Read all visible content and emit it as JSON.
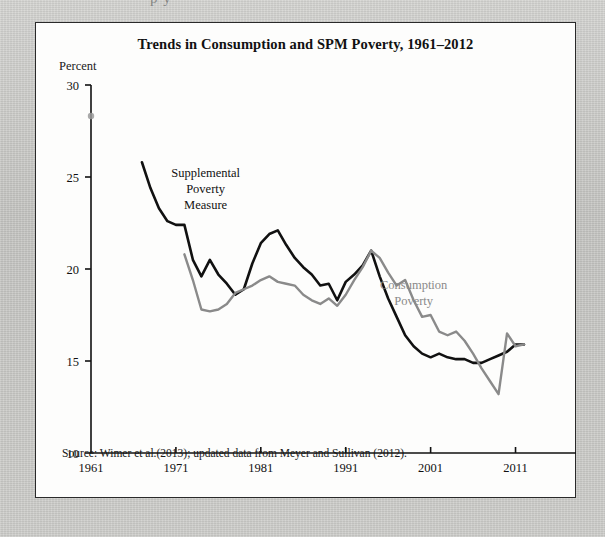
{
  "page": {
    "background_color": "#c9c9c6",
    "panel_background": "#fdfdfc",
    "partial_top_text": "p        y"
  },
  "figure": {
    "title": "Trends in Consumption and SPM Poverty, 1961–2012",
    "y_axis_title": "Percent",
    "source_note": "Source: Wimer et al.(2013); updated data from Meyer and Sullivan (2012)."
  },
  "chart_data": {
    "type": "line",
    "title": "Trends in Consumption and SPM Poverty, 1961–2012",
    "xlabel": "",
    "ylabel": "Percent",
    "xlim": [
      1961,
      2014
    ],
    "ylim": [
      10,
      30
    ],
    "xticks": [
      1961,
      1971,
      1981,
      1991,
      2001,
      2011
    ],
    "xtick_labels": [
      "1961",
      "1971",
      "1981",
      "1991",
      "2001",
      "2011"
    ],
    "yticks": [
      10,
      15,
      20,
      25,
      30
    ],
    "ytick_labels": [
      "10",
      "15",
      "20",
      "25",
      "30"
    ],
    "grid": false,
    "legend_position": "inline-annotations",
    "annotations": [
      {
        "text": "Supplemental Poverty Measure",
        "lines": [
          "Supplemental",
          "Poverty",
          "Measure"
        ],
        "color": "#111111",
        "x": 1974.5,
        "y": 25.0
      },
      {
        "text": "Consumption Poverty",
        "lines": [
          "Consumption",
          "Poverty"
        ],
        "color": "#8a8a8a",
        "x": 1999.0,
        "y": 18.9
      }
    ],
    "series": [
      {
        "name": "Supplemental Poverty Measure",
        "color": "#111111",
        "x": [
          1967,
          1968,
          1969,
          1970,
          1971,
          1972,
          1973,
          1974,
          1975,
          1976,
          1977,
          1978,
          1979,
          1980,
          1981,
          1982,
          1983,
          1984,
          1985,
          1986,
          1987,
          1988,
          1989,
          1990,
          1991,
          1992,
          1993,
          1994,
          1995,
          1996,
          1997,
          1998,
          1999,
          2000,
          2001,
          2002,
          2003,
          2004,
          2005,
          2006,
          2007,
          2008,
          2009,
          2010,
          2011,
          2012
        ],
        "values": [
          25.8,
          24.4,
          23.3,
          22.6,
          22.4,
          22.4,
          20.5,
          19.6,
          20.5,
          19.7,
          19.2,
          18.6,
          18.9,
          20.3,
          21.4,
          21.9,
          22.1,
          21.3,
          20.6,
          20.1,
          19.7,
          19.1,
          19.2,
          18.3,
          19.3,
          19.7,
          20.2,
          21.0,
          19.6,
          18.4,
          17.4,
          16.4,
          15.8,
          15.4,
          15.2,
          15.4,
          15.2,
          15.1,
          15.1,
          14.9,
          14.9,
          15.1,
          15.3,
          15.5,
          15.9,
          15.9
        ]
      },
      {
        "name": "Consumption Poverty",
        "color": "#8a8a8a",
        "x": [
          1972,
          1973,
          1974,
          1975,
          1976,
          1977,
          1978,
          1979,
          1980,
          1981,
          1982,
          1983,
          1984,
          1985,
          1986,
          1987,
          1988,
          1989,
          1990,
          1991,
          1992,
          1993,
          1994,
          1995,
          1996,
          1997,
          1998,
          1999,
          2000,
          2001,
          2002,
          2003,
          2004,
          2005,
          2006,
          2007,
          2008,
          2009,
          2010,
          2011,
          2012
        ],
        "values": [
          20.8,
          19.4,
          17.8,
          17.7,
          17.8,
          18.1,
          18.7,
          18.9,
          19.1,
          19.4,
          19.6,
          19.3,
          19.2,
          19.1,
          18.6,
          18.3,
          18.1,
          18.4,
          18.0,
          18.6,
          19.4,
          20.1,
          21.0,
          20.6,
          19.8,
          19.1,
          19.4,
          18.3,
          17.4,
          17.5,
          16.6,
          16.4,
          16.6,
          16.1,
          15.4,
          14.6,
          13.9,
          13.2,
          16.5,
          15.8,
          15.9
        ]
      }
    ]
  }
}
